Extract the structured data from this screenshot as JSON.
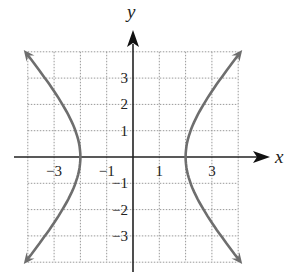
{
  "chart_data": {
    "type": "line",
    "title": "",
    "xlabel": "x",
    "ylabel": "y",
    "xlim": [
      -4,
      4
    ],
    "ylim": [
      -4,
      4
    ],
    "grid": true,
    "x_ticks": [
      {
        "v": -3,
        "label": "−3"
      },
      {
        "v": -1,
        "label": "−1"
      },
      {
        "v": 1,
        "label": "1"
      },
      {
        "v": 3,
        "label": "3"
      }
    ],
    "y_ticks": [
      {
        "v": 3,
        "label": "3"
      },
      {
        "v": 2,
        "label": "2"
      },
      {
        "v": 1,
        "label": "1"
      },
      {
        "v": -1,
        "label": "−1"
      },
      {
        "v": -2,
        "label": "−2"
      },
      {
        "v": -3,
        "label": "−3"
      }
    ],
    "series": [
      {
        "name": "hyperbola",
        "equation": "x^2/4 - y^2/5 = 1",
        "vertices": [
          [
            -2,
            0
          ],
          [
            2,
            0
          ]
        ],
        "color": "#6e6e6e"
      }
    ]
  }
}
